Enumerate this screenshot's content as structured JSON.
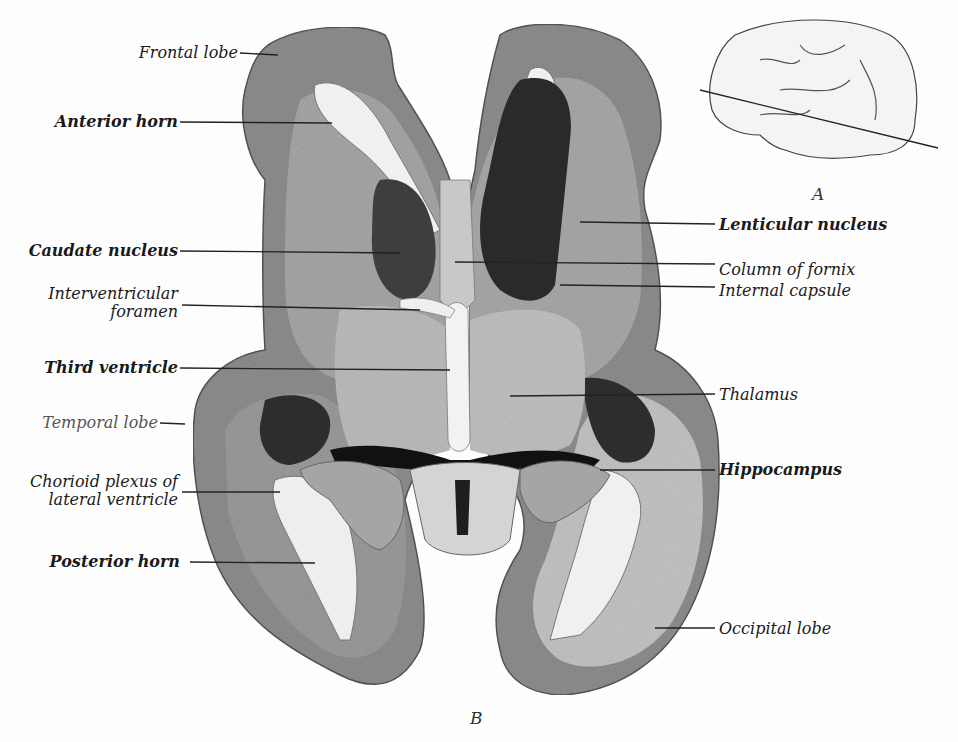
{
  "figure": {
    "main_caption": "B",
    "inset_caption": "A"
  },
  "labels_left": [
    {
      "id": "frontal-lobe",
      "text": "Frontal lobe",
      "weight": "normal"
    },
    {
      "id": "anterior-horn",
      "text": "Anterior horn",
      "weight": "bold"
    },
    {
      "id": "caudate-nucleus",
      "text": "Caudate nucleus",
      "weight": "bold"
    },
    {
      "id": "interventricular-foramen",
      "text": "Interventricular",
      "text2": "foramen",
      "weight": "normal"
    },
    {
      "id": "third-ventricle",
      "text": "Third ventricle",
      "weight": "bold"
    },
    {
      "id": "temporal-lobe",
      "text": "Temporal lobe",
      "weight": "light"
    },
    {
      "id": "chorioid-plexus",
      "text": "Chorioid plexus of",
      "text2": "lateral ventricle",
      "weight": "normal"
    },
    {
      "id": "posterior-horn",
      "text": "Posterior horn",
      "weight": "bold"
    }
  ],
  "labels_right": [
    {
      "id": "lenticular-nucleus",
      "text": "Lenticular nucleus",
      "weight": "bold"
    },
    {
      "id": "column-of-fornix",
      "text": "Column of fornix",
      "weight": "normal"
    },
    {
      "id": "internal-capsule",
      "text": "Internal capsule",
      "weight": "normal"
    },
    {
      "id": "thalamus",
      "text": "Thalamus",
      "weight": "normal"
    },
    {
      "id": "hippocampus",
      "text": "Hippocampus",
      "weight": "bold"
    },
    {
      "id": "occipital-lobe",
      "text": "Occipital lobe",
      "weight": "normal"
    }
  ]
}
